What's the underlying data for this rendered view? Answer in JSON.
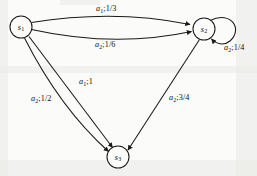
{
  "figure": {
    "type": "state-transition-diagram",
    "width": 257,
    "height": 176,
    "background_color": "#fbfbfa",
    "stroke_color": "#1a1a1a"
  },
  "nodes": [
    {
      "id": "s1",
      "label": "s",
      "subscript": "1",
      "cx": 21,
      "cy": 27,
      "r": 11
    },
    {
      "id": "s2",
      "label": "s",
      "subscript": "2",
      "cx": 204,
      "cy": 29,
      "r": 11
    },
    {
      "id": "s3",
      "label": "s",
      "subscript": "3",
      "cx": 118,
      "cy": 157,
      "r": 11
    }
  ],
  "edges": [
    {
      "id": "s1-s2-upper",
      "from": "s1",
      "to": "s2",
      "action": "a",
      "action_sub": "1",
      "probability": "1/3",
      "label": "a1;1/3",
      "label_x": 96,
      "label_y": 5
    },
    {
      "id": "s1-s2-lower",
      "from": "s1",
      "to": "s2",
      "action": "a",
      "action_sub": "2",
      "probability": "1/6",
      "label": "a2;1/6",
      "label_x": 95,
      "label_y": 41
    },
    {
      "id": "s2-self-loop",
      "from": "s2",
      "to": "s2",
      "action": "a",
      "action_sub": "2",
      "probability": "1/4",
      "label": "a2;1/4",
      "label_x": 224,
      "label_y": 44
    },
    {
      "id": "s1-s3-inner",
      "from": "s1",
      "to": "s3",
      "action": "a",
      "action_sub": "1",
      "probability": "1",
      "label": "a1;1",
      "label_x": 79,
      "label_y": 78
    },
    {
      "id": "s1-s3-outer",
      "from": "s1",
      "to": "s3",
      "action": "a",
      "action_sub": "2",
      "probability": "1/2",
      "label": "a2;1/2",
      "label_x": 31,
      "label_y": 95
    },
    {
      "id": "s2-s3",
      "from": "s2",
      "to": "s3",
      "action": "a",
      "action_sub": "2",
      "probability": "3/4",
      "label": "a2;3/4",
      "label_x": 169,
      "label_y": 94
    }
  ],
  "separators": {
    "action_probability": ";"
  }
}
